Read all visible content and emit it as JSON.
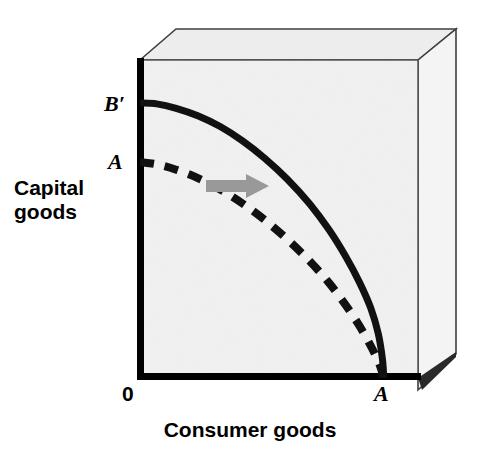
{
  "figure": {
    "kind": "production-possibilities-frontier",
    "background_color": "#ffffff",
    "plot_fill_color": "#f2f2f2",
    "box_top_fill_color": "#ededed",
    "box_side_fill_color": "#f5f5f5",
    "axis_color": "#000000",
    "curve_color": "#111111",
    "arrow_color": "#999999",
    "edge_color": "#3a3a3a"
  },
  "axes": {
    "y_title": "Capital\ngoods",
    "y_title_line1": "Capital",
    "y_title_line2": "goods",
    "x_title": "Consumer goods",
    "origin_label": "0"
  },
  "labels": {
    "curve_new_endpoint_y": "B′",
    "curve_old_endpoint_y": "A",
    "endpoint_x": "A"
  },
  "chart_data": {
    "type": "line",
    "title": "",
    "xlabel": "Consumer goods",
    "ylabel": "Capital goods",
    "grid": false,
    "legend": "none",
    "xlim": [
      0,
      1
    ],
    "ylim": [
      0,
      1
    ],
    "annotations": [
      {
        "text": "B′",
        "x": 0.0,
        "y": 0.865,
        "role": "new-frontier-y-intercept"
      },
      {
        "text": "A",
        "x": 0.0,
        "y": 0.679,
        "role": "old-frontier-y-intercept"
      },
      {
        "text": "0",
        "x": 0.0,
        "y": 0.0,
        "role": "origin"
      },
      {
        "text": "A",
        "x": 0.877,
        "y": 0.0,
        "role": "shared-x-intercept"
      },
      {
        "text": "→",
        "x": 0.32,
        "y": 0.6,
        "role": "outward-shift-arrow"
      }
    ],
    "series": [
      {
        "name": "New production possibilities frontier (B′A)",
        "style": "solid",
        "width_px": 7,
        "color": "#111111",
        "points": [
          {
            "x": 0.0,
            "y": 0.865
          },
          {
            "x": 0.06,
            "y": 0.862
          },
          {
            "x": 0.13,
            "y": 0.848
          },
          {
            "x": 0.21,
            "y": 0.824
          },
          {
            "x": 0.29,
            "y": 0.79
          },
          {
            "x": 0.37,
            "y": 0.745
          },
          {
            "x": 0.45,
            "y": 0.69
          },
          {
            "x": 0.53,
            "y": 0.625
          },
          {
            "x": 0.61,
            "y": 0.548
          },
          {
            "x": 0.68,
            "y": 0.466
          },
          {
            "x": 0.74,
            "y": 0.382
          },
          {
            "x": 0.79,
            "y": 0.3
          },
          {
            "x": 0.83,
            "y": 0.22
          },
          {
            "x": 0.857,
            "y": 0.14
          },
          {
            "x": 0.872,
            "y": 0.06
          },
          {
            "x": 0.877,
            "y": 0.0
          }
        ]
      },
      {
        "name": "Original production possibilities frontier (AA)",
        "style": "dashed",
        "width_px": 8,
        "dash_pattern": "14 11",
        "color": "#111111",
        "points": [
          {
            "x": 0.0,
            "y": 0.679
          },
          {
            "x": 0.06,
            "y": 0.672
          },
          {
            "x": 0.13,
            "y": 0.655
          },
          {
            "x": 0.21,
            "y": 0.628
          },
          {
            "x": 0.29,
            "y": 0.592
          },
          {
            "x": 0.37,
            "y": 0.548
          },
          {
            "x": 0.45,
            "y": 0.496
          },
          {
            "x": 0.53,
            "y": 0.436
          },
          {
            "x": 0.61,
            "y": 0.368
          },
          {
            "x": 0.68,
            "y": 0.299
          },
          {
            "x": 0.74,
            "y": 0.229
          },
          {
            "x": 0.79,
            "y": 0.163
          },
          {
            "x": 0.83,
            "y": 0.101
          },
          {
            "x": 0.86,
            "y": 0.046
          },
          {
            "x": 0.877,
            "y": 0.0
          }
        ]
      }
    ]
  },
  "arrow": {
    "direction": "right",
    "meaning": "economic growth / outward shift",
    "color": "#999999"
  }
}
